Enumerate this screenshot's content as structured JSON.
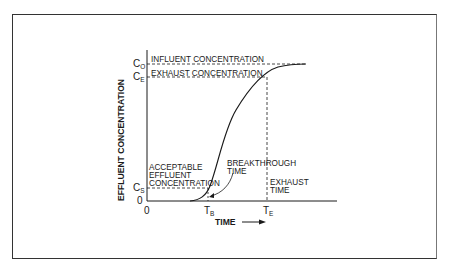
{
  "diagram": {
    "y_axis_label": "EFFLUENT CONCENTRATION",
    "x_axis_label": "TIME",
    "x_axis_arrow": "arrow-right",
    "y_ticks": {
      "c0": {
        "main": "C",
        "sub": "O"
      },
      "ce": {
        "main": "C",
        "sub": "E"
      },
      "cs": {
        "main": "C",
        "sub": "S"
      },
      "zero": "0"
    },
    "x_ticks": {
      "zero": "0",
      "tb": {
        "main": "T",
        "sub": "B"
      },
      "te": {
        "main": "T",
        "sub": "E"
      }
    },
    "annotations": {
      "influent": "INFLUENT CONCENTRATION",
      "exhaust": "EXHAUST CONCENTRATION",
      "acceptable_line1": "ACCEPTABLE",
      "acceptable_line2": "EFFLUENT",
      "acceptable_line3": "CONCENTRATION",
      "breakthrough_line1": "BREAKTHROUGH",
      "breakthrough_line2": "TIME",
      "exhaust_time_line1": "EXHAUST",
      "exhaust_time_line2": "TIME"
    },
    "colors": {
      "line": "#1a1a1a",
      "frame": "#333333",
      "background": "#ffffff"
    }
  }
}
